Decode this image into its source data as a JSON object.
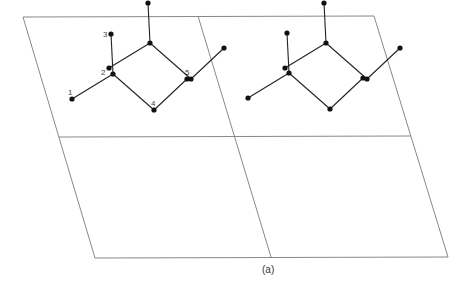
{
  "figure": {
    "caption": "(a)",
    "lattice": {
      "corners": {
        "top_left": [
          23,
          17
        ],
        "top_right": [
          374,
          16
        ],
        "bottom_left": [
          95,
          258
        ],
        "bottom_right": [
          448,
          257
        ]
      },
      "grid": [
        2,
        2
      ]
    },
    "atom_labels": [
      "1",
      "2",
      "3",
      "4",
      "5"
    ],
    "molecule_offsets": [
      [
        0,
        0
      ],
      [
        176,
        -1
      ],
      [
        37,
        -31
      ],
      [
        213,
        -31
      ]
    ],
    "molecule_atoms": [
      {
        "label": "1",
        "x": 72,
        "y": 99
      },
      {
        "label": "2",
        "x": 113,
        "y": 74
      },
      {
        "label": "3",
        "x": 111,
        "y": 34
      },
      {
        "label": "4",
        "x": 154,
        "y": 110
      },
      {
        "label": "5",
        "x": 187,
        "y": 79
      }
    ],
    "bonds": [
      [
        "1",
        "2"
      ],
      [
        "2",
        "3"
      ],
      [
        "2",
        "4"
      ],
      [
        "4",
        "5"
      ]
    ]
  }
}
